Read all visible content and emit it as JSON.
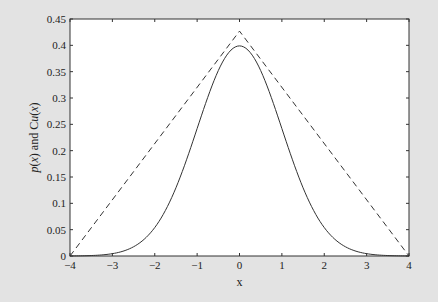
{
  "chart_data": {
    "type": "line",
    "title": "",
    "xlabel": "x",
    "ylabel": "p(x) and Cu(x)",
    "xlim": [
      -4,
      4
    ],
    "ylim": [
      0,
      0.45
    ],
    "xticks": [
      -4,
      -3,
      -2,
      -1,
      0,
      1,
      2,
      3,
      4
    ],
    "xtick_labels": [
      "−4",
      "−3",
      "−2",
      "−1",
      "0",
      "1",
      "2",
      "3",
      "4"
    ],
    "yticks": [
      0,
      0.05,
      0.1,
      0.15,
      0.2,
      0.25,
      0.3,
      0.35,
      0.4,
      0.45
    ],
    "ytick_labels": [
      "0",
      "0.05",
      "0.1",
      "0.15",
      "0.2",
      "0.25",
      "0.3",
      "0.35",
      "0.4",
      "0.45"
    ],
    "grid": false,
    "legend": null,
    "series": [
      {
        "name": "p(x)",
        "style": "solid",
        "description": "standard normal density",
        "x": [
          -4,
          -3.5,
          -3,
          -2.5,
          -2,
          -1.5,
          -1,
          -0.5,
          0,
          0.5,
          1,
          1.5,
          2,
          2.5,
          3,
          3.5,
          4
        ],
        "values": [
          0.0001,
          0.0009,
          0.0044,
          0.0175,
          0.054,
          0.1295,
          0.242,
          0.3521,
          0.3989,
          0.3521,
          0.242,
          0.1295,
          0.054,
          0.0175,
          0.0044,
          0.0009,
          0.0001
        ]
      },
      {
        "name": "Cu(x)",
        "style": "dashed",
        "description": "triangular envelope",
        "x": [
          -4,
          0,
          4
        ],
        "values": [
          0,
          0.427,
          0
        ]
      }
    ],
    "colors": {
      "line": "#333333",
      "axes_bg": "#ffffff",
      "figure_bg": "#e3e3e3"
    }
  }
}
